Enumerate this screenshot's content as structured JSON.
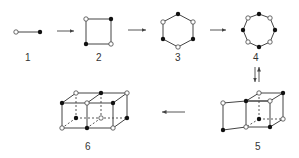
{
  "figure": {
    "colors": {
      "line": "#444444",
      "filled_vertex": "#111111",
      "open_vertex": "#ffffff",
      "label": "#333333"
    },
    "structures": [
      {
        "id": "1",
        "label": "1",
        "shape": "dimer (line segment)"
      },
      {
        "id": "2",
        "label": "2",
        "shape": "square"
      },
      {
        "id": "3",
        "label": "3",
        "shape": "hexagon"
      },
      {
        "id": "4",
        "label": "4",
        "shape": "octagon"
      },
      {
        "id": "5",
        "label": "5",
        "shape": "prism-fused cube"
      },
      {
        "id": "6",
        "label": "6",
        "shape": "double cube"
      }
    ],
    "arrows": [
      {
        "from": "1",
        "to": "2",
        "direction": "right"
      },
      {
        "from": "2",
        "to": "3",
        "direction": "right"
      },
      {
        "from": "3",
        "to": "4",
        "direction": "right"
      },
      {
        "from": "4",
        "to": "5",
        "direction": "equilibrium (down/up)"
      },
      {
        "from": "5",
        "to": "6",
        "direction": "left"
      }
    ]
  }
}
